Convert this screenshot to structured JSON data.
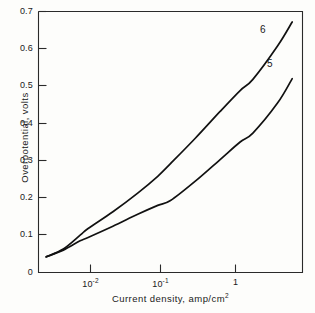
{
  "chart_data": {
    "type": "line",
    "title": "",
    "xlabel": "Current density, amp/cm²",
    "ylabel": "Overpotential, volts",
    "xscale": "log",
    "yscale": "linear",
    "xlim": [
      0.0025,
      4.0
    ],
    "ylim": [
      0,
      0.7
    ],
    "grid": false,
    "legend_position": "inline-curve-labels",
    "x_tick_labels": [
      "10⁻²",
      "10⁻¹",
      "1"
    ],
    "x_tick_values": [
      0.01,
      0.1,
      1
    ],
    "y_tick_labels": [
      "0",
      "0.1",
      "0.2",
      "0.3",
      "0.4",
      "0.5",
      "0.6",
      "0.7"
    ],
    "y_tick_values": [
      0,
      0.1,
      0.2,
      0.3,
      0.4,
      0.5,
      0.6,
      0.7
    ],
    "series": [
      {
        "name": "6",
        "label": "6",
        "color": "#111111",
        "x": [
          0.0031,
          0.005,
          0.008,
          0.01,
          0.02,
          0.04,
          0.07,
          0.1,
          0.2,
          0.4,
          0.7,
          1.0,
          2.0,
          3.0
        ],
        "y": [
          0.042,
          0.063,
          0.1,
          0.118,
          0.163,
          0.213,
          0.258,
          0.292,
          0.36,
          0.432,
          0.488,
          0.518,
          0.608,
          0.672
        ]
      },
      {
        "name": "5",
        "label": "5",
        "color": "#111111",
        "x": [
          0.0031,
          0.005,
          0.008,
          0.01,
          0.02,
          0.04,
          0.07,
          0.1,
          0.2,
          0.4,
          0.7,
          1.0,
          2.0,
          3.0
        ],
        "y": [
          0.042,
          0.06,
          0.085,
          0.094,
          0.124,
          0.156,
          0.18,
          0.193,
          0.245,
          0.303,
          0.35,
          0.374,
          0.455,
          0.52
        ]
      }
    ],
    "annotations": [
      {
        "text": "6",
        "x_px": 263,
        "y_px": 31
      },
      {
        "text": "5",
        "x_px": 270,
        "y_px": 65
      }
    ]
  },
  "axis": {
    "y_title": "Overpotential, volts",
    "x_title_parts": {
      "text": "Current density, amp/cm",
      "exponent": "2"
    },
    "x_ticks": [
      {
        "mantissa": "10",
        "exponent": "-2",
        "x_px": 90
      },
      {
        "mantissa": "10",
        "exponent": "-1",
        "x_px": 160
      },
      {
        "mantissa": "1",
        "exponent": "",
        "x_px": 235
      }
    ],
    "y_ticks": [
      {
        "label": "0.7",
        "y_px": 11
      },
      {
        "label": "0.6",
        "y_px": 48
      },
      {
        "label": "0.5",
        "y_px": 85
      },
      {
        "label": "0.4",
        "y_px": 123
      },
      {
        "label": "0.3",
        "y_px": 160
      },
      {
        "label": "0.2",
        "y_px": 197
      },
      {
        "label": "0.1",
        "y_px": 234
      },
      {
        "label": "0",
        "y_px": 272
      }
    ]
  }
}
